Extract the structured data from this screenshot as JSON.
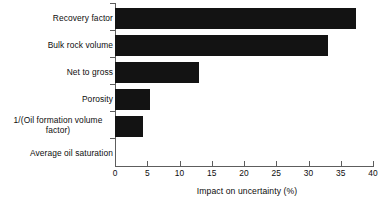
{
  "chart_data": {
    "type": "bar",
    "orientation": "horizontal",
    "title": "",
    "subtitle": "",
    "xlabel": "Impact on uncertainty (%)",
    "ylabel": "",
    "categories": [
      "Recovery factor",
      "Bulk rock volume",
      "Net to gross",
      "Porosity",
      "1/(Oil formation volume factor)",
      "Average oil saturation"
    ],
    "category_display": [
      "Recovery factor",
      "Bulk rock volume",
      "Net to gross",
      "Porosity",
      "1/(Oil formation volume\nfactor)",
      "Average oil saturation"
    ],
    "values": [
      37.4,
      33.0,
      13.1,
      5.4,
      4.3,
      0
    ],
    "xlim": [
      0,
      40
    ],
    "xticks": [
      0,
      5,
      10,
      15,
      20,
      25,
      30,
      35,
      40
    ],
    "xticklabels": [
      "0",
      "5",
      "10",
      "15",
      "20",
      "25",
      "30",
      "35",
      "40"
    ],
    "grid": false,
    "legend": false,
    "bar_color": "#131313",
    "axis_color": "#5d5d5d"
  }
}
